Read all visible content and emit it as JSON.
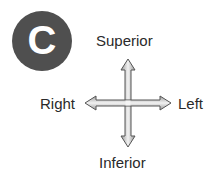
{
  "badge": {
    "letter": "C",
    "color": "#4f4f4f"
  },
  "labels": {
    "top": "Superior",
    "bottom": "Inferior",
    "left_side": "Right",
    "right_side": "Left"
  },
  "arrow": {
    "fill": "#bdbdbd",
    "stroke": "#555555"
  }
}
